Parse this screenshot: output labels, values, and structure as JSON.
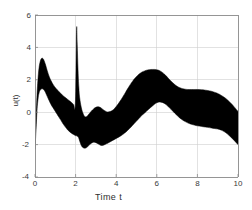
{
  "figure": {
    "background_color": "#ffffff",
    "band_color": "#000000",
    "axis_color": "#808080",
    "grid_color": "#c8c8c8"
  },
  "chart_data": {
    "type": "area",
    "title": "",
    "xlabel": "Time  t",
    "ylabel": "u(t)",
    "xlim": [
      0,
      10
    ],
    "ylim": [
      -4,
      6
    ],
    "xticks": [
      0,
      2,
      4,
      6,
      8,
      10
    ],
    "yticks": [
      -4,
      -2,
      0,
      2,
      4,
      6
    ],
    "xticklabels": [
      "0",
      "2",
      "4",
      "6",
      "8",
      "10"
    ],
    "yticklabels": [
      "-4",
      "-2",
      "0",
      "2",
      "4",
      "6"
    ],
    "grid": true,
    "legend": null,
    "annotations": [],
    "series": [
      {
        "name": "upper envelope",
        "x": [
          0.0,
          0.05,
          0.1,
          0.15,
          0.2,
          0.25,
          0.3,
          0.35,
          0.4,
          0.45,
          0.5,
          0.55,
          0.6,
          0.7,
          0.8,
          0.9,
          1.0,
          1.1,
          1.2,
          1.3,
          1.4,
          1.5,
          1.6,
          1.7,
          1.8,
          1.9,
          1.98,
          2.02,
          2.05,
          2.08,
          2.12,
          2.16,
          2.2,
          2.28,
          2.36,
          2.44,
          2.52,
          2.6,
          2.7,
          2.8,
          2.9,
          3.0,
          3.1,
          3.2,
          3.3,
          3.4,
          3.5,
          3.6,
          3.8,
          4.0,
          4.2,
          4.4,
          4.6,
          4.8,
          5.0,
          5.2,
          5.4,
          5.6,
          5.8,
          6.0,
          6.2,
          6.4,
          6.6,
          6.8,
          7.0,
          7.2,
          7.4,
          7.6,
          7.8,
          8.0,
          8.4,
          8.8,
          9.2,
          9.6,
          10.0
        ],
        "values": [
          -2.25,
          -0.4,
          1.1,
          2.1,
          2.75,
          3.1,
          3.28,
          3.33,
          3.3,
          3.18,
          3.0,
          2.8,
          2.58,
          2.2,
          1.92,
          1.7,
          1.52,
          1.38,
          1.24,
          1.12,
          1.0,
          0.9,
          0.8,
          0.7,
          0.6,
          0.48,
          0.36,
          2.6,
          5.2,
          4.2,
          2.6,
          1.55,
          0.9,
          0.3,
          -0.05,
          -0.25,
          -0.28,
          -0.2,
          -0.05,
          0.1,
          0.22,
          0.3,
          0.33,
          0.3,
          0.22,
          0.12,
          0.05,
          0.02,
          0.1,
          0.35,
          0.7,
          1.1,
          1.52,
          1.9,
          2.2,
          2.42,
          2.55,
          2.62,
          2.64,
          2.62,
          2.52,
          2.32,
          2.05,
          1.8,
          1.6,
          1.48,
          1.42,
          1.4,
          1.4,
          1.4,
          1.36,
          1.25,
          1.02,
          0.62,
          0.05
        ]
      },
      {
        "name": "lower envelope",
        "x": [
          0.0,
          0.05,
          0.1,
          0.15,
          0.2,
          0.25,
          0.3,
          0.35,
          0.4,
          0.45,
          0.5,
          0.55,
          0.6,
          0.7,
          0.8,
          0.9,
          1.0,
          1.1,
          1.2,
          1.3,
          1.4,
          1.5,
          1.6,
          1.7,
          1.8,
          1.9,
          1.98,
          2.02,
          2.05,
          2.08,
          2.12,
          2.16,
          2.2,
          2.28,
          2.36,
          2.44,
          2.52,
          2.6,
          2.7,
          2.8,
          2.9,
          3.0,
          3.1,
          3.2,
          3.3,
          3.4,
          3.5,
          3.6,
          3.8,
          4.0,
          4.2,
          4.4,
          4.6,
          4.8,
          5.0,
          5.2,
          5.4,
          5.6,
          5.8,
          6.0,
          6.2,
          6.4,
          6.6,
          6.8,
          7.0,
          7.2,
          7.4,
          7.6,
          7.8,
          8.0,
          8.4,
          8.8,
          9.2,
          9.6,
          10.0
        ],
        "values": [
          -2.3,
          -1.1,
          0.1,
          0.8,
          1.18,
          1.35,
          1.42,
          1.44,
          1.42,
          1.36,
          1.26,
          1.12,
          0.98,
          0.7,
          0.45,
          0.25,
          0.05,
          -0.15,
          -0.35,
          -0.55,
          -0.75,
          -0.92,
          -1.08,
          -1.2,
          -1.3,
          -1.38,
          -1.44,
          -1.45,
          -1.46,
          -1.48,
          -1.52,
          -1.62,
          -1.78,
          -2.05,
          -2.18,
          -2.22,
          -2.2,
          -2.12,
          -2.0,
          -1.9,
          -1.85,
          -1.88,
          -1.95,
          -2.02,
          -2.05,
          -2.02,
          -1.96,
          -1.9,
          -1.76,
          -1.62,
          -1.48,
          -1.3,
          -1.08,
          -0.82,
          -0.55,
          -0.28,
          -0.05,
          0.18,
          0.4,
          0.58,
          0.62,
          0.52,
          0.3,
          0.05,
          -0.2,
          -0.42,
          -0.58,
          -0.7,
          -0.78,
          -0.84,
          -0.92,
          -1.0,
          -1.12,
          -1.48,
          -2.0
        ]
      }
    ],
    "features": {
      "spike_time": 2.05,
      "spike_peak": 5.2,
      "first_peak_time": 0.4,
      "first_peak_value": 3.33,
      "main_hump_time": 6.0,
      "main_hump_value": 2.64,
      "start_value": -2.3,
      "end_upper": 0.05,
      "end_lower": -2.0
    }
  },
  "axes": {
    "x_tick_labels": [
      "0",
      "2",
      "4",
      "6",
      "8",
      "10"
    ],
    "y_tick_labels": [
      "6",
      "4",
      "2",
      "0",
      "-2",
      "-4"
    ],
    "xlabel": "Time  t",
    "ylabel": "u(t)"
  }
}
